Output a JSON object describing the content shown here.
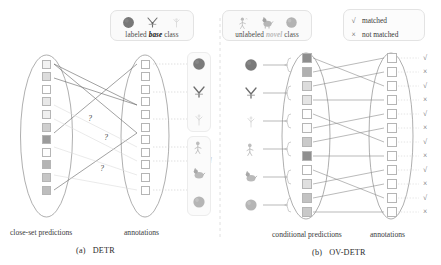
{
  "figure": {
    "legend_base": {
      "text_pre": "labeled ",
      "text_em": "base",
      "text_post": " class",
      "icons": [
        "ball-dark-icon",
        "bird-icon",
        "plant-faint-icon"
      ]
    },
    "legend_novel": {
      "text_pre": "unlabeled ",
      "text_em": "novel",
      "text_post": " class",
      "icons": [
        "person-faint-icon",
        "dog-icon",
        "ball-gray-icon"
      ]
    },
    "match_legend": {
      "matched_mark": "√",
      "matched_label": "matched",
      "not_matched_mark": "×",
      "not_matched_label": "not matched"
    },
    "divider_labels": {
      "base": "base",
      "novel": "novel"
    },
    "panel_a": {
      "caption_id": "(a)",
      "caption_name": "DETR",
      "left_label": "close-set predictions",
      "right_label": "annotations",
      "question_marks": [
        "?",
        "?",
        "?"
      ],
      "predictions": [
        {
          "fill": "#f2f2f2"
        },
        {
          "fill": "#dcdcdc"
        },
        {
          "fill": "#ffffff"
        },
        {
          "fill": "#e8e8e8"
        },
        {
          "fill": "#f0f0f0"
        },
        {
          "fill": "#cfcfcf"
        },
        {
          "fill": "#9b9b9b"
        },
        {
          "fill": "#fdfdfd"
        },
        {
          "fill": "#b4b4b4"
        },
        {
          "fill": "#c6c6c6"
        },
        {
          "fill": "#bdbdbd"
        }
      ],
      "annotations": [
        {
          "fill": "#ffffff"
        },
        {
          "fill": "#ffffff"
        },
        {
          "fill": "#ffffff"
        },
        {
          "fill": "#ffffff"
        },
        {
          "fill": "#ffffff"
        },
        {
          "fill": "#ffffff"
        },
        {
          "fill": "#ffffff"
        },
        {
          "fill": "#ffffff"
        },
        {
          "fill": "#ffffff"
        },
        {
          "fill": "#ffffff"
        },
        {
          "fill": "#ffffff"
        }
      ],
      "thumb_group_base": [
        "ball-dark-icon",
        "bird-icon",
        "plant-faint-icon"
      ],
      "thumb_group_novel": [
        "person-faint-icon",
        "dog-icon",
        "ball-gray-icon"
      ]
    },
    "panel_b": {
      "caption_id": "(b)",
      "caption_name": "OV-DETR",
      "left_label": "conditional predictions",
      "right_label": "annotations",
      "conditioned_thumbs": [
        "ball-dark-icon",
        "bird-icon",
        "plant-faint-icon",
        "person-faint-icon",
        "dog-icon",
        "ball-gray-icon"
      ],
      "predictions": [
        {
          "fill": "#8e8e8e"
        },
        {
          "fill": "#b0b0b0"
        },
        {
          "fill": "#dcdcdc"
        },
        {
          "fill": "#e4e4e4"
        },
        {
          "fill": "#ffffff"
        },
        {
          "fill": "#fbfbfb"
        },
        {
          "fill": "#cacaca"
        },
        {
          "fill": "#8f8f8f"
        },
        {
          "fill": "#ffffff"
        },
        {
          "fill": "#e0e0e0"
        },
        {
          "fill": "#c2c2c2"
        },
        {
          "fill": "#c9c9c9"
        }
      ],
      "annotations": [
        {
          "fill": "#ffffff"
        },
        {
          "fill": "#ffffff"
        },
        {
          "fill": "#ffffff"
        },
        {
          "fill": "#ffffff"
        },
        {
          "fill": "#ffffff"
        },
        {
          "fill": "#ffffff"
        },
        {
          "fill": "#ffffff"
        },
        {
          "fill": "#ffffff"
        },
        {
          "fill": "#ffffff"
        },
        {
          "fill": "#ffffff"
        },
        {
          "fill": "#ffffff"
        },
        {
          "fill": "#ffffff"
        }
      ],
      "match_marks": [
        "√",
        "×",
        "√",
        "×",
        "√",
        "×",
        "√",
        "×",
        "√",
        "×",
        "√",
        "×"
      ]
    },
    "colors": {
      "stroke": "#8d8d8d",
      "faint_stroke": "#dedede",
      "ellipse": "#9a9a9a",
      "text": "#2b2b2b"
    }
  }
}
